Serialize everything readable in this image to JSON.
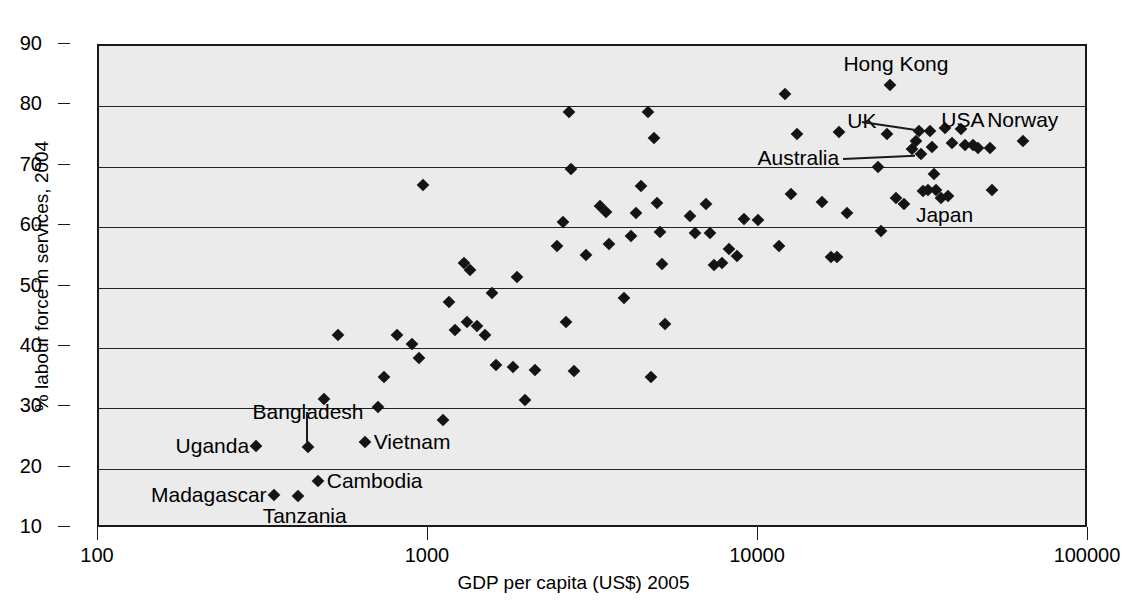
{
  "chart_data": {
    "type": "scatter",
    "title": "",
    "xlabel": "GDP per capita (US$) 2005",
    "ylabel": "% labour force in services, 2004",
    "xscale": "log",
    "xlim": [
      100,
      100000
    ],
    "ylim": [
      10,
      90
    ],
    "xticks": [
      100,
      1000,
      10000,
      100000
    ],
    "xtick_labels": [
      "100",
      "1000",
      "10000",
      "100000"
    ],
    "yticks": [
      10,
      20,
      30,
      40,
      50,
      60,
      70,
      80,
      90
    ],
    "ytick_labels": [
      "10",
      "20",
      "30",
      "40",
      "50",
      "60",
      "70",
      "80",
      "90"
    ],
    "grid": "horizontal",
    "legend": "none",
    "marker": "diamond",
    "marker_color": "#141414",
    "plot_background": "#ebebeb",
    "points": [
      {
        "x": 300,
        "y": 23.7,
        "label": "Uganda"
      },
      {
        "x": 340,
        "y": 15.6,
        "label": "Madagascar"
      },
      {
        "x": 400,
        "y": 15.4,
        "label": "Tanzania"
      },
      {
        "x": 430,
        "y": 23.5,
        "label": "Bangladesh"
      },
      {
        "x": 460,
        "y": 17.9,
        "label": "Cambodia"
      },
      {
        "x": 640,
        "y": 24.4,
        "label": "Vietnam"
      },
      {
        "x": 25000,
        "y": 83.5,
        "label": "Hong Kong"
      },
      {
        "x": 33000,
        "y": 75.9,
        "label": "UK"
      },
      {
        "x": 31000,
        "y": 72.1,
        "label": "Australia"
      },
      {
        "x": 41000,
        "y": 76.2,
        "label": "USA"
      },
      {
        "x": 63000,
        "y": 74.3,
        "label": "Norway"
      },
      {
        "x": 34500,
        "y": 66.2,
        "label": "Japan"
      },
      {
        "x": 480,
        "y": 31.6,
        "label": ""
      },
      {
        "x": 530,
        "y": 42.1,
        "label": ""
      },
      {
        "x": 700,
        "y": 30.2,
        "label": ""
      },
      {
        "x": 730,
        "y": 35.2,
        "label": ""
      },
      {
        "x": 800,
        "y": 42.2,
        "label": ""
      },
      {
        "x": 890,
        "y": 40.6,
        "label": ""
      },
      {
        "x": 930,
        "y": 38.4,
        "label": ""
      },
      {
        "x": 960,
        "y": 67.0,
        "label": ""
      },
      {
        "x": 1100,
        "y": 28.1,
        "label": ""
      },
      {
        "x": 1150,
        "y": 47.6,
        "label": ""
      },
      {
        "x": 1200,
        "y": 42.9,
        "label": ""
      },
      {
        "x": 1280,
        "y": 54.1,
        "label": ""
      },
      {
        "x": 1300,
        "y": 44.3,
        "label": ""
      },
      {
        "x": 1330,
        "y": 52.9,
        "label": ""
      },
      {
        "x": 1400,
        "y": 43.6,
        "label": ""
      },
      {
        "x": 1480,
        "y": 42.2,
        "label": ""
      },
      {
        "x": 1550,
        "y": 49.1,
        "label": ""
      },
      {
        "x": 1600,
        "y": 37.2,
        "label": ""
      },
      {
        "x": 1800,
        "y": 36.9,
        "label": ""
      },
      {
        "x": 1850,
        "y": 51.7,
        "label": ""
      },
      {
        "x": 1950,
        "y": 31.4,
        "label": ""
      },
      {
        "x": 2100,
        "y": 36.4,
        "label": ""
      },
      {
        "x": 2450,
        "y": 56.8,
        "label": ""
      },
      {
        "x": 2550,
        "y": 60.8,
        "label": ""
      },
      {
        "x": 2600,
        "y": 44.3,
        "label": ""
      },
      {
        "x": 2650,
        "y": 79.0,
        "label": ""
      },
      {
        "x": 2700,
        "y": 69.6,
        "label": ""
      },
      {
        "x": 2750,
        "y": 36.2,
        "label": ""
      },
      {
        "x": 3000,
        "y": 55.4,
        "label": ""
      },
      {
        "x": 3300,
        "y": 63.5,
        "label": ""
      },
      {
        "x": 3450,
        "y": 62.5,
        "label": ""
      },
      {
        "x": 3500,
        "y": 57.2,
        "label": ""
      },
      {
        "x": 3900,
        "y": 48.3,
        "label": ""
      },
      {
        "x": 4100,
        "y": 58.6,
        "label": ""
      },
      {
        "x": 4250,
        "y": 62.3,
        "label": ""
      },
      {
        "x": 4400,
        "y": 66.8,
        "label": ""
      },
      {
        "x": 4600,
        "y": 79.0,
        "label": ""
      },
      {
        "x": 4700,
        "y": 35.2,
        "label": ""
      },
      {
        "x": 4800,
        "y": 74.8,
        "label": ""
      },
      {
        "x": 4900,
        "y": 64.0,
        "label": ""
      },
      {
        "x": 5000,
        "y": 59.2,
        "label": ""
      },
      {
        "x": 5100,
        "y": 53.9,
        "label": ""
      },
      {
        "x": 5200,
        "y": 44.0,
        "label": ""
      },
      {
        "x": 6200,
        "y": 61.8,
        "label": ""
      },
      {
        "x": 6400,
        "y": 59.0,
        "label": ""
      },
      {
        "x": 6900,
        "y": 63.9,
        "label": ""
      },
      {
        "x": 7100,
        "y": 59.1,
        "label": ""
      },
      {
        "x": 7300,
        "y": 53.8,
        "label": ""
      },
      {
        "x": 7700,
        "y": 54.0,
        "label": ""
      },
      {
        "x": 8100,
        "y": 56.4,
        "label": ""
      },
      {
        "x": 8600,
        "y": 55.2,
        "label": ""
      },
      {
        "x": 9000,
        "y": 61.4,
        "label": ""
      },
      {
        "x": 9900,
        "y": 61.1,
        "label": ""
      },
      {
        "x": 11500,
        "y": 56.8,
        "label": ""
      },
      {
        "x": 12000,
        "y": 82.1,
        "label": ""
      },
      {
        "x": 12500,
        "y": 65.5,
        "label": ""
      },
      {
        "x": 13000,
        "y": 75.4,
        "label": ""
      },
      {
        "x": 15500,
        "y": 64.1,
        "label": ""
      },
      {
        "x": 16500,
        "y": 55.1,
        "label": ""
      },
      {
        "x": 17200,
        "y": 55.1,
        "label": ""
      },
      {
        "x": 17500,
        "y": 75.8,
        "label": ""
      },
      {
        "x": 18500,
        "y": 62.4,
        "label": ""
      },
      {
        "x": 23000,
        "y": 70.0,
        "label": ""
      },
      {
        "x": 23500,
        "y": 59.4,
        "label": ""
      },
      {
        "x": 24500,
        "y": 75.5,
        "label": ""
      },
      {
        "x": 26000,
        "y": 64.8,
        "label": ""
      },
      {
        "x": 27500,
        "y": 63.8,
        "label": ""
      },
      {
        "x": 29000,
        "y": 73.0,
        "label": ""
      },
      {
        "x": 30000,
        "y": 74.3,
        "label": ""
      },
      {
        "x": 30500,
        "y": 76.0,
        "label": ""
      },
      {
        "x": 31500,
        "y": 66.0,
        "label": ""
      },
      {
        "x": 32500,
        "y": 66.2,
        "label": ""
      },
      {
        "x": 33500,
        "y": 73.2,
        "label": ""
      },
      {
        "x": 34000,
        "y": 68.8,
        "label": ""
      },
      {
        "x": 35500,
        "y": 64.8,
        "label": ""
      },
      {
        "x": 36500,
        "y": 76.4,
        "label": ""
      },
      {
        "x": 37500,
        "y": 65.1,
        "label": ""
      },
      {
        "x": 38500,
        "y": 74.0,
        "label": ""
      },
      {
        "x": 42000,
        "y": 73.6,
        "label": ""
      },
      {
        "x": 44500,
        "y": 73.6,
        "label": ""
      },
      {
        "x": 46000,
        "y": 73.1,
        "label": ""
      },
      {
        "x": 50000,
        "y": 73.1,
        "label": ""
      },
      {
        "x": 51000,
        "y": 66.1,
        "label": ""
      }
    ],
    "annotations": [
      {
        "text": "Hong Kong",
        "anchor_x": 26000,
        "anchor_y": 87.0,
        "align": "center",
        "leader": false
      },
      {
        "text": "UK",
        "anchor_x": 20500,
        "anchor_y": 77.6,
        "align": "center",
        "leader": true,
        "to_x": 33000,
        "to_y": 75.9
      },
      {
        "text": "USA",
        "anchor_x": 41500,
        "anchor_y": 77.8,
        "align": "center",
        "leader": false
      },
      {
        "text": "Norway",
        "anchor_x": 63000,
        "anchor_y": 77.8,
        "align": "center",
        "leader": false
      },
      {
        "text": "Australia",
        "anchor_x": 17500,
        "anchor_y": 71.5,
        "align": "right",
        "leader": true,
        "to_x": 31000,
        "to_y": 72.1
      },
      {
        "text": "Japan",
        "anchor_x": 36500,
        "anchor_y": 62.0,
        "align": "center",
        "leader": false
      },
      {
        "text": "Bangladesh",
        "anchor_x": 430,
        "anchor_y": 29.4,
        "align": "center",
        "leader": true,
        "to_x": 430,
        "to_y": 23.5
      },
      {
        "text": "Uganda",
        "anchor_x": 285,
        "anchor_y": 23.7,
        "align": "right",
        "leader": false
      },
      {
        "text": "Vietnam",
        "anchor_x": 680,
        "anchor_y": 24.4,
        "align": "left",
        "leader": false
      },
      {
        "text": "Cambodia",
        "anchor_x": 490,
        "anchor_y": 17.9,
        "align": "left",
        "leader": false
      },
      {
        "text": "Madagascar",
        "anchor_x": 322,
        "anchor_y": 15.6,
        "align": "right",
        "leader": false
      },
      {
        "text": "Tanzania",
        "anchor_x": 420,
        "anchor_y": 12.2,
        "align": "center",
        "leader": false
      }
    ]
  }
}
